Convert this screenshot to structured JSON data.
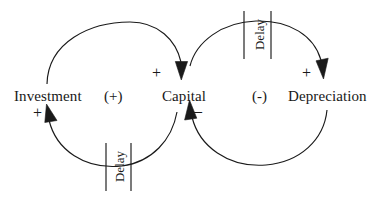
{
  "diagram": {
    "type": "causal-loop-diagram",
    "background_color": "#ffffff",
    "stroke_color": "#1a1a1a",
    "text_color": "#181818",
    "nodes": [
      {
        "id": "investment",
        "label": "Investment"
      },
      {
        "id": "capital",
        "label": "Capital"
      },
      {
        "id": "depreciation",
        "label": "Depreciation"
      }
    ],
    "loops": [
      {
        "id": "left-loop",
        "label": "(+)",
        "polarity": "reinforcing"
      },
      {
        "id": "right-loop",
        "label": "(-)",
        "polarity": "balancing"
      }
    ],
    "links": [
      {
        "id": "investment-to-capital",
        "from": "Investment",
        "to": "Capital",
        "polarity_label": "+",
        "delay": false
      },
      {
        "id": "capital-to-investment",
        "from": "Capital",
        "to": "Investment",
        "polarity_label": "+",
        "delay": true,
        "delay_label": "Delay"
      },
      {
        "id": "capital-to-depreciation",
        "from": "Capital",
        "to": "Depreciation",
        "polarity_label": "+",
        "delay": true,
        "delay_label": "Delay"
      },
      {
        "id": "depreciation-to-capital",
        "from": "Depreciation",
        "to": "Capital",
        "polarity_label": "–",
        "delay": false
      }
    ],
    "delays": [
      {
        "id": "delay-top",
        "label": "Delay"
      },
      {
        "id": "delay-bottom",
        "label": "Delay"
      }
    ]
  }
}
